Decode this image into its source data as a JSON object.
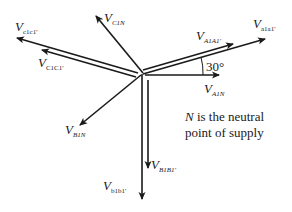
{
  "diagram": {
    "type": "phasor-diagram",
    "origin": [
      143,
      73
    ],
    "colors": {
      "stroke": "#1a1a1a",
      "background": "#ffffff"
    },
    "vectors": [
      {
        "id": "V_C1N",
        "base": "V",
        "subscript": "C1N",
        "tip": [
          96,
          16
        ]
      },
      {
        "id": "V_c1c1p",
        "base": "V",
        "subscript": "c1c1'",
        "tip": [
          17,
          38
        ]
      },
      {
        "id": "V_C1C1p",
        "base": "V",
        "subscript": "C1C1'",
        "tip": [
          42,
          50
        ]
      },
      {
        "id": "V_A1A1p",
        "base": "V",
        "subscript": "A1A1'",
        "tip": [
          233,
          44
        ]
      },
      {
        "id": "V_a1a1p",
        "base": "V",
        "subscript": "a1a1'",
        "tip": [
          265,
          39
        ]
      },
      {
        "id": "V_A1N",
        "base": "V",
        "subscript": "A1N",
        "tip": [
          219,
          75
        ]
      },
      {
        "id": "V_B1N",
        "base": "V",
        "subscript": "B1N",
        "tip": [
          80,
          125
        ]
      },
      {
        "id": "V_B1B1p",
        "base": "V",
        "subscript": "B1B1'",
        "tip": [
          148,
          168
        ]
      },
      {
        "id": "V_b1b1p",
        "base": "V",
        "subscript": "b1b1'",
        "tip": [
          142,
          199
        ]
      }
    ],
    "angle_label": "30°",
    "note_line1_italic": "N",
    "note_line1_rest": " is the neutral",
    "note_line2": "point of supply"
  }
}
